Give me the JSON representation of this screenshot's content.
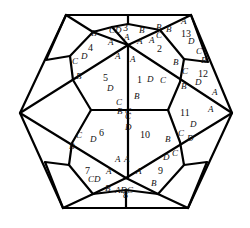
{
  "diagram": {
    "type": "polyhedron-net-projection",
    "stroke_color": "#000000",
    "background": "#ffffff",
    "face_numbers": [
      {
        "id": "1",
        "x": 140,
        "y": 80
      },
      {
        "id": "2",
        "x": 160,
        "y": 49
      },
      {
        "id": "3",
        "x": 126,
        "y": 28
      },
      {
        "id": "4",
        "x": 91,
        "y": 48
      },
      {
        "id": "5",
        "x": 106,
        "y": 78
      },
      {
        "id": "6",
        "x": 102,
        "y": 133
      },
      {
        "id": "7",
        "x": 88,
        "y": 171
      },
      {
        "id": "8",
        "x": 126,
        "y": 195
      },
      {
        "id": "9",
        "x": 161,
        "y": 171
      },
      {
        "id": "10",
        "x": 143,
        "y": 135
      },
      {
        "id": "11",
        "x": 183,
        "y": 113
      },
      {
        "id": "12",
        "x": 201,
        "y": 74
      },
      {
        "id": "13",
        "x": 184,
        "y": 34
      }
    ],
    "vertex_labels": [
      {
        "t": "A",
        "x": 184,
        "y": 22
      },
      {
        "t": "B",
        "x": 159,
        "y": 28
      },
      {
        "t": "B",
        "x": 169,
        "y": 30
      },
      {
        "t": "C",
        "x": 159,
        "y": 36
      },
      {
        "t": "D",
        "x": 191,
        "y": 42
      },
      {
        "t": "C",
        "x": 199,
        "y": 52
      },
      {
        "t": "B",
        "x": 204,
        "y": 61
      },
      {
        "t": "B",
        "x": 176,
        "y": 63
      },
      {
        "t": "C",
        "x": 185,
        "y": 72
      },
      {
        "t": "D",
        "x": 150,
        "y": 80
      },
      {
        "t": "C",
        "x": 163,
        "y": 81
      },
      {
        "t": "D",
        "x": 198,
        "y": 83
      },
      {
        "t": "B",
        "x": 184,
        "y": 87
      },
      {
        "t": "A",
        "x": 215,
        "y": 93
      },
      {
        "t": "A",
        "x": 133,
        "y": 60
      },
      {
        "t": "B",
        "x": 137,
        "y": 97
      },
      {
        "t": "A",
        "x": 140,
        "y": 42
      },
      {
        "t": "A",
        "x": 152,
        "y": 41
      },
      {
        "t": "CD",
        "x": 112,
        "y": 31
      },
      {
        "t": "B",
        "x": 142,
        "y": 31
      },
      {
        "t": "B",
        "x": 94,
        "y": 34
      },
      {
        "t": "A",
        "x": 111,
        "y": 43
      },
      {
        "t": "A",
        "x": 118,
        "y": 57
      },
      {
        "t": "A",
        "x": 127,
        "y": 38
      },
      {
        "t": "D",
        "x": 84,
        "y": 57
      },
      {
        "t": "C",
        "x": 75,
        "y": 62
      },
      {
        "t": "B",
        "x": 79,
        "y": 77
      },
      {
        "t": "D",
        "x": 110,
        "y": 89
      },
      {
        "t": "C",
        "x": 119,
        "y": 103
      },
      {
        "t": "B",
        "x": 120,
        "y": 112
      },
      {
        "t": "C",
        "x": 128,
        "y": 112
      },
      {
        "t": "C",
        "x": 128,
        "y": 117
      },
      {
        "t": "D",
        "x": 128,
        "y": 128
      },
      {
        "t": "D",
        "x": 93,
        "y": 140
      },
      {
        "t": "C",
        "x": 79,
        "y": 136
      },
      {
        "t": "B",
        "x": 72,
        "y": 147
      },
      {
        "t": "A",
        "x": 118,
        "y": 160
      },
      {
        "t": "A",
        "x": 127,
        "y": 160
      },
      {
        "t": "A",
        "x": 109,
        "y": 172
      },
      {
        "t": "A",
        "x": 139,
        "y": 172
      },
      {
        "t": "CD",
        "x": 91,
        "y": 180
      },
      {
        "t": "B",
        "x": 108,
        "y": 189
      },
      {
        "t": "ADC",
        "x": 118,
        "y": 191
      },
      {
        "t": "B",
        "x": 154,
        "y": 184
      },
      {
        "t": "D",
        "x": 166,
        "y": 158
      },
      {
        "t": "C",
        "x": 175,
        "y": 154
      },
      {
        "t": "B",
        "x": 168,
        "y": 140
      },
      {
        "t": "C",
        "x": 181,
        "y": 134
      },
      {
        "t": "D",
        "x": 193,
        "y": 125
      },
      {
        "t": "A",
        "x": 211,
        "y": 110
      },
      {
        "t": "D",
        "x": 190,
        "y": 139
      }
    ]
  }
}
